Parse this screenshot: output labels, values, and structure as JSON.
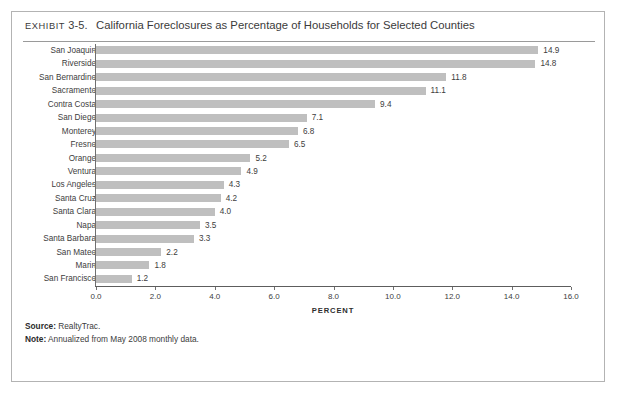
{
  "exhibit": {
    "label": "EXHIBIT",
    "number": "3-5.",
    "title": "California Foreclosures as Percentage of Households for Selected Counties"
  },
  "footer": {
    "source_key": "Source:",
    "source_value": "RealtyTrac.",
    "note_key": "Note:",
    "note_value": "Annualized from May 2008 monthly data."
  },
  "style": {
    "bar_color": "#bfbfbf",
    "axis_color": "#5d5d5d",
    "text_color": "#3d3d3d",
    "border_color": "#b3b3b3"
  },
  "chart_data": {
    "type": "bar",
    "orientation": "horizontal",
    "title": "California Foreclosures as Percentage of Households for Selected Counties",
    "xlabel": "PERCENT",
    "ylabel": "",
    "xlim": [
      0.0,
      16.0
    ],
    "xticks": [
      "0.0",
      "2.0",
      "4.0",
      "6.0",
      "8.0",
      "10.0",
      "12.0",
      "14.0",
      "16.0"
    ],
    "xtick_values": [
      0.0,
      2.0,
      4.0,
      6.0,
      8.0,
      10.0,
      12.0,
      14.0,
      16.0
    ],
    "grid": false,
    "legend": false,
    "data_labels": true,
    "categories": [
      "San Joaquin",
      "Riverside",
      "San Bernardino",
      "Sacramento",
      "Contra Costa",
      "San Diego",
      "Monterey",
      "Fresno",
      "Orange",
      "Ventura",
      "Los Angeles",
      "Santa Cruz",
      "Santa Clara",
      "Napa",
      "Santa Barbara",
      "San Mateo",
      "Marin",
      "San Francisco"
    ],
    "values": [
      14.9,
      14.8,
      11.8,
      11.1,
      9.4,
      7.1,
      6.8,
      6.5,
      5.2,
      4.9,
      4.3,
      4.2,
      4.0,
      3.5,
      3.3,
      2.2,
      1.8,
      1.2
    ],
    "value_labels": [
      "14.9",
      "14.8",
      "11.8",
      "11.1",
      "9.4",
      "7.1",
      "6.8",
      "6.5",
      "5.2",
      "4.9",
      "4.3",
      "4.2",
      "4.0",
      "3.5",
      "3.3",
      "2.2",
      "1.8",
      "1.2"
    ]
  }
}
